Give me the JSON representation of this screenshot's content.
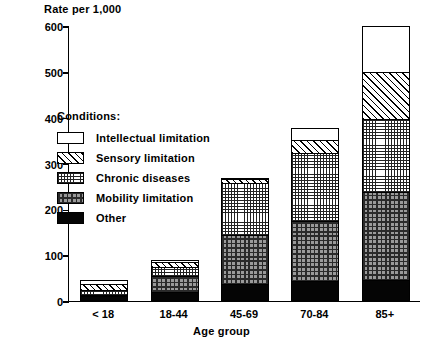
{
  "chart_data": {
    "type": "bar",
    "subtype": "stacked-bar",
    "title": "",
    "ylabel": "Rate per 1,000",
    "xlabel": "Age group",
    "ylim": [
      0,
      600
    ],
    "yticks": [
      0,
      100,
      200,
      300,
      400,
      500,
      600
    ],
    "ytick_labels": [
      "0",
      "100",
      "200",
      "300",
      "400",
      "500",
      "600"
    ],
    "grid": false,
    "legend_position": "inside-upper-left",
    "legend_title": "Conditions:",
    "categories": [
      "< 18",
      "18-44",
      "45-69",
      "70-84",
      "85+"
    ],
    "stack_order_bottom_to_top": [
      "Other",
      "Mobility limitation",
      "Chronic diseases",
      "Sensory limitation",
      "Intellectual limitation"
    ],
    "series": [
      {
        "name": "Other",
        "pattern": "solid-black",
        "values": [
          8,
          18,
          35,
          42,
          43
        ]
      },
      {
        "name": "Mobility limitation",
        "pattern": "checker-gray",
        "values": [
          3,
          34,
          107,
          130,
          192
        ]
      },
      {
        "name": "Chronic diseases",
        "pattern": "fine-dot-grid",
        "values": [
          11,
          20,
          113,
          148,
          160
        ]
      },
      {
        "name": "Sensory limitation",
        "pattern": "diagonal-hatch",
        "values": [
          13,
          11,
          8,
          30,
          102
        ]
      },
      {
        "name": "Intellectual limitation",
        "pattern": "white-empty",
        "values": [
          8,
          5,
          2,
          25,
          101
        ]
      }
    ],
    "totals": [
      43,
      88,
      265,
      375,
      598
    ],
    "cumulative_tops": [
      [
        8,
        11,
        22,
        35,
        43
      ],
      [
        18,
        52,
        72,
        83,
        88
      ],
      [
        35,
        142,
        255,
        263,
        265
      ],
      [
        42,
        172,
        320,
        350,
        375
      ],
      [
        43,
        235,
        395,
        497,
        598
      ]
    ]
  },
  "legend": {
    "title": "Conditions:",
    "items": [
      {
        "label": "Intellectual limitation",
        "pattern": "white-empty"
      },
      {
        "label": "Sensory limitation",
        "pattern": "diagonal-hatch"
      },
      {
        "label": "Chronic diseases",
        "pattern": "fine-dot-grid"
      },
      {
        "label": "Mobility limitation",
        "pattern": "checker-gray"
      },
      {
        "label": "Other",
        "pattern": "solid-black"
      }
    ]
  },
  "colors": {
    "axis": "#000000",
    "background": "#ffffff",
    "ink": "#000000",
    "mobility_fill": "#9a9a9a",
    "other_fill": "#050505"
  }
}
